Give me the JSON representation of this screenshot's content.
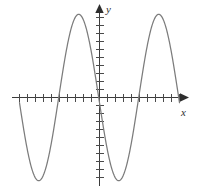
{
  "figure": {
    "kind": "math-graph",
    "background_color": "#ffffff",
    "axis_color": "#3b3b3b",
    "tick_color": "#4a4a4a",
    "curve_color": "#7c7c7c",
    "x_axis_label": "x",
    "y_axis_label": "y"
  },
  "chart_data": {
    "type": "line",
    "title": "",
    "xlabel": "x",
    "ylabel": "y",
    "grid": false,
    "legend": null,
    "axis_style": "arrows-both-ends-tick-marks-unlabeled",
    "xlim": [
      -11,
      11
    ],
    "ylim": [
      -11.5,
      11.5
    ],
    "x_tick_count": 21,
    "y_tick_count": 22,
    "x_tick_interval": 1,
    "y_tick_interval": 1,
    "series": [
      {
        "name": "sinusoid",
        "form": "amplitude * cos(2*pi*(x - phase)/period)",
        "amplitude": 10.4,
        "period": 10,
        "phase": -2.6,
        "midline": 0,
        "peaks": [
          {
            "x": -2.6,
            "y": 10.4
          },
          {
            "x": 7.4,
            "y": 10.4
          }
        ],
        "troughs": [
          {
            "x": -7.4,
            "y": -10.4
          },
          {
            "x": 2.6,
            "y": -10.4
          }
        ],
        "zero_crossings": [
          -5.0,
          -0.1,
          5.0,
          10.0
        ],
        "x_range_drawn": [
          -10.0,
          10.0
        ],
        "x": [
          -10.0,
          -9.5,
          -9.0,
          -8.5,
          -8.0,
          -7.5,
          -7.0,
          -6.5,
          -6.0,
          -5.5,
          -5.0,
          -4.5,
          -4.0,
          -3.5,
          -3.0,
          -2.5,
          -2.0,
          -1.5,
          -1.0,
          -0.5,
          0.0,
          0.5,
          1.0,
          1.5,
          2.0,
          2.5,
          3.0,
          3.5,
          4.0,
          4.5,
          5.0,
          5.5,
          6.0,
          6.5,
          7.0,
          7.5,
          8.0,
          8.5,
          9.0,
          9.5,
          10.0
        ],
        "y": [
          0.0,
          -3.2,
          -6.1,
          -8.4,
          -9.9,
          -10.4,
          -9.9,
          -8.4,
          -6.1,
          -3.2,
          0.0,
          3.2,
          6.1,
          8.4,
          9.9,
          10.4,
          9.9,
          8.4,
          6.1,
          3.2,
          0.0,
          -3.2,
          -6.1,
          -8.4,
          -9.9,
          -10.4,
          -9.9,
          -8.4,
          -6.1,
          -3.2,
          0.0,
          3.2,
          6.1,
          8.4,
          9.9,
          10.4,
          9.9,
          8.4,
          6.1,
          3.2,
          0.0
        ]
      }
    ]
  }
}
